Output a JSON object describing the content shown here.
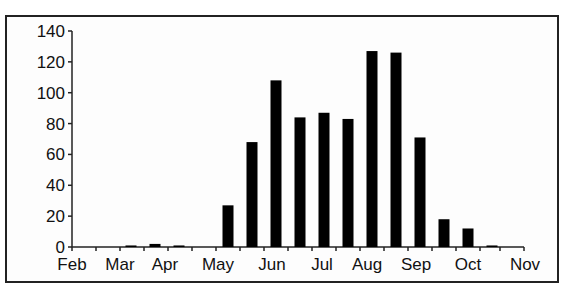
{
  "chart_data": {
    "type": "bar",
    "title": "",
    "xlabel": "",
    "ylabel": "",
    "ylim": [
      0,
      140
    ],
    "yticks": [
      0,
      20,
      40,
      60,
      80,
      100,
      120,
      140
    ],
    "xtick_labels": [
      "Feb",
      "Mar",
      "Apr",
      "May",
      "Jun",
      "Jul",
      "Aug",
      "Sep",
      "Oct",
      "Nov"
    ],
    "grid": false,
    "legend": null,
    "bin_description": "half-month bins",
    "categories": [
      "Mar (early)",
      "Mar (late)",
      "Apr (early)",
      "May (early)",
      "May (late)",
      "Jun (early)",
      "Jun (late)",
      "Jul (early)",
      "Jul (late)",
      "Aug (early)",
      "Aug (late)",
      "Sep (early)",
      "Sep (late)",
      "Oct (early)",
      "Oct (late)"
    ],
    "values": [
      1,
      2,
      1,
      27,
      68,
      108,
      84,
      87,
      83,
      127,
      126,
      71,
      18,
      12,
      1
    ],
    "bar_color": "#000000"
  },
  "layout": {
    "axis": {
      "x0": 72,
      "x1": 524,
      "y0": 247,
      "ytop": 31
    },
    "bar_width": 11,
    "bar_centers": [
      131,
      155,
      179,
      228,
      252,
      276,
      300,
      324,
      348,
      372,
      396,
      420,
      444,
      468,
      492
    ],
    "xtick_positions": [
      72,
      96,
      120,
      144,
      168,
      192,
      216,
      240,
      264,
      288,
      312,
      336,
      360,
      384,
      408,
      432,
      456,
      480,
      500,
      524
    ],
    "xlabel_positions": [
      72,
      120,
      165,
      218,
      272,
      322,
      367,
      416,
      468,
      525
    ]
  }
}
